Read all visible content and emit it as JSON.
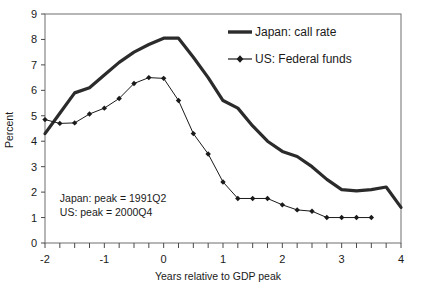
{
  "chart_data": {
    "type": "line",
    "title": "",
    "xlabel": "Years relative to GDP peak",
    "ylabel": "Percent",
    "xlim": [
      -2,
      4
    ],
    "ylim": [
      0,
      9
    ],
    "yticks": [
      0,
      1,
      2,
      3,
      4,
      5,
      6,
      7,
      8,
      9
    ],
    "ytick_labels": [
      "0",
      "1",
      "2",
      "3",
      "4",
      "5",
      "6",
      "7",
      "8",
      "9"
    ],
    "xticks": [
      -2,
      -1,
      0,
      1,
      2,
      3,
      4
    ],
    "xtick_labels": [
      "-2",
      "-1",
      "0",
      "1",
      "2",
      "3",
      "4"
    ],
    "minor_xtick_step": 0.25,
    "grid": false,
    "legend_position": "top-right",
    "series": [
      {
        "name": "Japan: call rate",
        "color": "#2b2b2b",
        "line_width": 3.2,
        "marker": "none",
        "x": [
          -2,
          -1.75,
          -1.5,
          -1.25,
          -1,
          -0.75,
          -0.5,
          -0.25,
          0,
          0.25,
          0.5,
          0.75,
          1,
          1.25,
          1.5,
          1.75,
          2,
          2.25,
          2.5,
          2.75,
          3,
          3.25,
          3.5,
          3.75,
          4
        ],
        "values": [
          4.3,
          5.1,
          5.9,
          6.1,
          6.6,
          7.1,
          7.5,
          7.8,
          8.05,
          8.05,
          7.3,
          6.5,
          5.6,
          5.3,
          4.6,
          4.0,
          3.6,
          3.4,
          3.0,
          2.5,
          2.1,
          2.05,
          2.1,
          2.2,
          1.4
        ]
      },
      {
        "name": "US: Federal funds",
        "color": "#1a1a1a",
        "line_width": 1.0,
        "marker": "diamond",
        "x": [
          -2,
          -1.75,
          -1.5,
          -1.25,
          -1,
          -0.75,
          -0.5,
          -0.25,
          0,
          0.25,
          0.5,
          0.75,
          1,
          1.25,
          1.5,
          1.75,
          2,
          2.25,
          2.5,
          2.75,
          3,
          3.25,
          3.5
        ],
        "values": [
          4.85,
          4.7,
          4.72,
          5.07,
          5.3,
          5.68,
          6.27,
          6.5,
          6.47,
          5.6,
          4.3,
          3.5,
          2.4,
          1.75,
          1.75,
          1.75,
          1.5,
          1.3,
          1.25,
          1.0,
          1.0,
          1.0,
          1.0
        ]
      }
    ],
    "annotations": [
      {
        "text": "Japan: peak = 1991Q2",
        "x": -1.75,
        "y": 1.6
      },
      {
        "text": "US: peak = 2000Q4",
        "x": -1.75,
        "y": 1.05
      }
    ]
  },
  "legend": {
    "items": [
      {
        "label": "Japan: call rate",
        "marker": "line"
      },
      {
        "label": "US: Federal funds",
        "marker": "line-diamond"
      }
    ]
  },
  "axes": {
    "y_axis_title": "Percent",
    "x_axis_title": "Years relative to GDP peak"
  }
}
